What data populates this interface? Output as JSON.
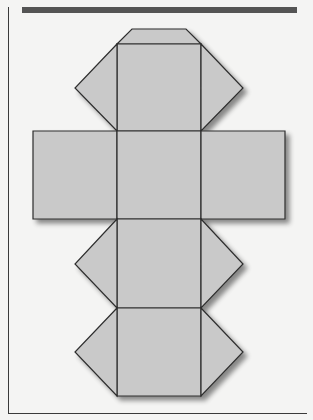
{
  "figure": {
    "title": "",
    "colors": {
      "face_fill": "#c9c9c9",
      "edge": "#2e2e2e",
      "background": "#f4f4f3",
      "top_bar": "#545454",
      "shadow": "#9a9a9a"
    },
    "faces": [
      {
        "name": "top-trapezoid",
        "points": "132,29 186,29 201,44 117,44"
      },
      {
        "name": "square-1",
        "points": "117,44 201,44 201,131 117,131"
      },
      {
        "name": "left-triangle-1",
        "points": "117,44 75,88 117,131"
      },
      {
        "name": "right-triangle-1",
        "points": "201,44 243,88 201,131"
      },
      {
        "name": "left-rectangle",
        "points": "33,131 117,131 117,219 33,219"
      },
      {
        "name": "square-2",
        "points": "117,131 201,131 201,219 117,219"
      },
      {
        "name": "right-rectangle",
        "points": "201,131 285,131 285,219 201,219"
      },
      {
        "name": "square-3",
        "points": "117,219 201,219 201,308 117,308"
      },
      {
        "name": "left-triangle-3",
        "points": "117,219 75,264 117,308"
      },
      {
        "name": "right-triangle-3",
        "points": "201,219 243,264 201,308"
      },
      {
        "name": "square-4",
        "points": "117,308 201,308 201,396 117,396"
      },
      {
        "name": "left-triangle-4",
        "points": "117,308 75,352 117,396"
      },
      {
        "name": "right-triangle-4",
        "points": "201,308 243,352 201,396"
      }
    ]
  }
}
